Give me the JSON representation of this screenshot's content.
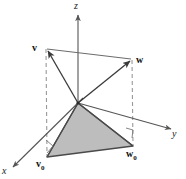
{
  "figure": {
    "colors": {
      "axis": "#555555",
      "vector": "#3a3a3a",
      "dashed": "#999999",
      "fill": "#bdbdbd",
      "fill_edge": "#4a4a4a",
      "label": "#111111",
      "background": "#ffffff"
    },
    "axes": [
      {
        "name": "z",
        "label": "z",
        "from": [
          78,
          103
        ],
        "to": [
          78,
          14
        ],
        "arrow": true
      },
      {
        "name": "x",
        "label": "x",
        "from": [
          78,
          103
        ],
        "to": [
          12,
          168
        ],
        "arrow": true
      },
      {
        "name": "y",
        "label": "y",
        "from": [
          78,
          103
        ],
        "to": [
          172,
          130
        ],
        "arrow": true
      }
    ],
    "labels": {
      "z": "z",
      "x": "x",
      "y": "y",
      "v": "v",
      "w": "w",
      "v0_base": "v",
      "v0_sub": "0",
      "w0_base": "w",
      "w0_sub": "0"
    },
    "points": {
      "origin": [
        78,
        103
      ],
      "v": [
        46,
        48
      ],
      "w": [
        132,
        59
      ],
      "v0": [
        47,
        157
      ],
      "w0": [
        133,
        146
      ]
    },
    "vectors": [
      {
        "name": "origin-to-v",
        "from": [
          78,
          103
        ],
        "to": [
          46,
          48
        ],
        "arrow": true
      },
      {
        "name": "origin-to-w",
        "from": [
          78,
          103
        ],
        "to": [
          132,
          59
        ],
        "arrow": true
      },
      {
        "name": "origin-to-v0",
        "from": [
          78,
          103
        ],
        "to": [
          47,
          157
        ],
        "arrow": false
      },
      {
        "name": "origin-to-w0",
        "from": [
          78,
          103
        ],
        "to": [
          133,
          146
        ],
        "arrow": false
      }
    ],
    "connectors": [
      {
        "name": "v-to-w-top-edge",
        "from": [
          46,
          48
        ],
        "to": [
          132,
          59
        ]
      },
      {
        "name": "v0-to-w0-base-edge",
        "from": [
          47,
          157
        ],
        "to": [
          133,
          146
        ]
      }
    ],
    "dashed_lines": [
      {
        "name": "v-to-v0-drop",
        "from": [
          46,
          48
        ],
        "to": [
          47,
          157
        ]
      },
      {
        "name": "w-to-w0-drop",
        "from": [
          132,
          59
        ],
        "to": [
          133,
          146
        ]
      }
    ],
    "shaded_region": {
      "name": "triangle-origin-v0-w0",
      "points": "78,103 47,157 133,146",
      "fill": "#bdbdbd",
      "stroke": "#4a4a4a"
    },
    "right_angles": [
      {
        "name": "right-angle-at-v0",
        "points": "47,140 54,147 47,154"
      },
      {
        "name": "right-angle-at-w0",
        "points": "126,129 133,129 133,139"
      }
    ]
  }
}
